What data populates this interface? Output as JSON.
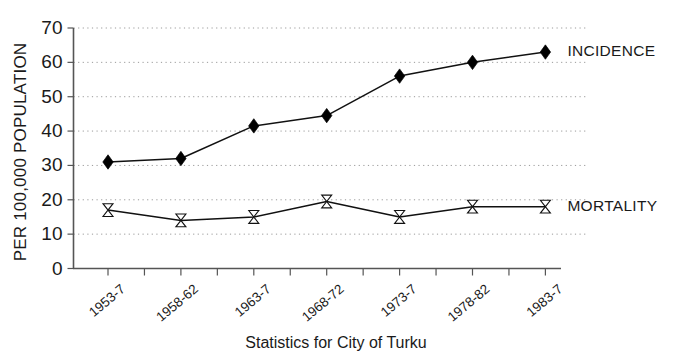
{
  "chart_data": {
    "type": "line",
    "title": "",
    "caption": "Statistics for City of Turku",
    "xlabel": "",
    "ylabel": "PER 100,000 POPULATION",
    "categories": [
      "1953-7",
      "1958-62",
      "1963-7",
      "1968-72",
      "1973-7",
      "1978-82",
      "1983-7"
    ],
    "ylim": [
      0,
      70
    ],
    "yticks": [
      0,
      10,
      20,
      30,
      40,
      50,
      60,
      70
    ],
    "ytick_labels": [
      "0",
      "10",
      "20",
      "30",
      "40",
      "50",
      "60",
      "70"
    ],
    "grid": "horizontal-dotted",
    "legend_position": "right-of-last-point",
    "series": [
      {
        "name": "INCIDENCE",
        "marker": "filled-diamond",
        "values": [
          31,
          32,
          41.5,
          44.5,
          56,
          60,
          63
        ]
      },
      {
        "name": "MORTALITY",
        "marker": "hollow-bowtie",
        "values": [
          17,
          14,
          15,
          19.5,
          15,
          18,
          18
        ]
      }
    ]
  },
  "colors": {
    "ink": "#111111",
    "axis": "#555555",
    "grid": "#9a9a9a",
    "background": "#ffffff"
  }
}
